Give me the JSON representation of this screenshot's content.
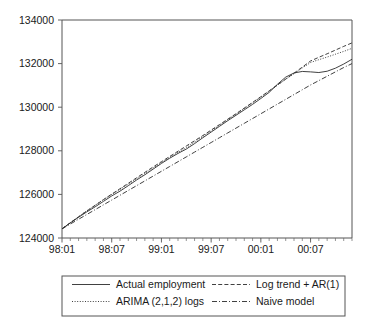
{
  "chart_data": {
    "type": "line",
    "title": "",
    "xlabel": "",
    "ylabel": "",
    "ylim": [
      124000,
      134000
    ],
    "yticks": [
      124000,
      126000,
      128000,
      130000,
      132000,
      134000
    ],
    "ytick_labels": [
      "124000",
      "126000",
      "128000",
      "130000",
      "132000",
      "134000"
    ],
    "xtick_labels": [
      "98:01",
      "98:07",
      "99:01",
      "99:07",
      "00:01",
      "00:07"
    ],
    "xtick_positions": [
      0,
      6,
      12,
      18,
      24,
      30
    ],
    "x_minor_count": 35,
    "xlim": [
      0,
      35
    ],
    "x": [
      0,
      1,
      2,
      3,
      4,
      5,
      6,
      7,
      8,
      9,
      10,
      11,
      12,
      13,
      14,
      15,
      16,
      17,
      18,
      19,
      20,
      21,
      22,
      23,
      24,
      25,
      26,
      27,
      28,
      29,
      30,
      31,
      32,
      33,
      34,
      35
    ],
    "grid": false,
    "legend_position": "below",
    "series": [
      {
        "name": "Actual employment",
        "style": "solid",
        "values": [
          124420,
          124690,
          124950,
          125200,
          125430,
          125680,
          125930,
          126150,
          126400,
          126660,
          126900,
          127160,
          127420,
          127660,
          127880,
          128080,
          128330,
          128600,
          128860,
          129120,
          129380,
          129630,
          129880,
          130130,
          130400,
          130680,
          131050,
          131380,
          131570,
          131640,
          131620,
          131590,
          131650,
          131790,
          131980,
          132200
        ]
      },
      {
        "name": "ARIMA (2,1,2) logs",
        "style": "dotted",
        "values": [
          124420,
          124700,
          124980,
          125250,
          125500,
          125760,
          126000,
          126230,
          126470,
          126720,
          126960,
          127210,
          127460,
          127700,
          127930,
          128150,
          128400,
          128660,
          128910,
          129170,
          129430,
          129680,
          129940,
          130200,
          130470,
          130740,
          131010,
          131280,
          131540,
          131800,
          132050,
          132180,
          132300,
          132430,
          132560,
          132700
        ]
      },
      {
        "name": "Log trend + AR(1)",
        "style": "dashed",
        "values": [
          124420,
          124700,
          124970,
          125240,
          125500,
          125760,
          126010,
          126260,
          126510,
          126760,
          127010,
          127260,
          127500,
          127740,
          127980,
          128220,
          128460,
          128700,
          128950,
          129200,
          129450,
          129700,
          129960,
          130220,
          130480,
          130750,
          131020,
          131290,
          131560,
          131840,
          132120,
          132290,
          132450,
          132620,
          132790,
          132950
        ]
      },
      {
        "name": "Naive model",
        "style": "dashdot",
        "values": [
          124420,
          124640,
          124860,
          125080,
          125300,
          125520,
          125740,
          125960,
          126180,
          126400,
          126620,
          126840,
          127060,
          127280,
          127500,
          127720,
          127940,
          128160,
          128380,
          128600,
          128820,
          129040,
          129260,
          129480,
          129700,
          129920,
          130140,
          130360,
          130580,
          130800,
          131020,
          131220,
          131420,
          131620,
          131820,
          132000
        ]
      }
    ]
  },
  "legend": {
    "entries": [
      {
        "label": "Actual employment",
        "style": "solid"
      },
      {
        "label": "Log trend + AR(1)",
        "style": "dashed"
      },
      {
        "label": "ARIMA (2,1,2) logs",
        "style": "dotted"
      },
      {
        "label": "Naive model",
        "style": "dashdot"
      }
    ]
  }
}
